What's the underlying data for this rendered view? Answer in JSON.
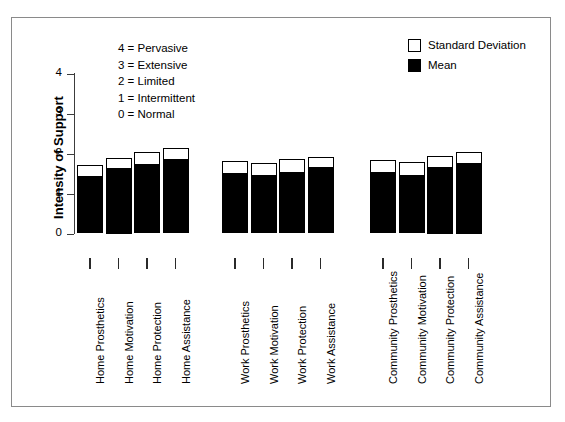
{
  "chart_data": {
    "type": "bar",
    "title": "",
    "xlabel": "",
    "ylabel": "Intensity of Support",
    "ylim": [
      0,
      4
    ],
    "ytick_labels": [
      "0",
      "1",
      "2",
      "3",
      "4"
    ],
    "ytick_values": [
      0,
      1,
      2,
      3,
      4
    ],
    "grid": false,
    "legend_position": "top-right",
    "categories": [
      "Home Prosthetics",
      "Home Motivation",
      "Home Protection",
      "Home Assistance",
      "Work Prosthetics",
      "Work Motivation",
      "Work Protection",
      "Work Assistance",
      "Community Prosthetics",
      "Community Motivation",
      "Community Protection",
      "Community Assistance"
    ],
    "series": [
      {
        "name": "Mean",
        "color": "#000000",
        "values": [
          1.45,
          1.65,
          1.75,
          1.88,
          1.53,
          1.47,
          1.55,
          1.68,
          1.55,
          1.48,
          1.68,
          1.78
        ]
      },
      {
        "name": "Standard Deviation",
        "color": "#ffffff",
        "note": "bar top = mean + standard deviation",
        "values": [
          1.72,
          1.9,
          2.03,
          2.13,
          1.82,
          1.76,
          1.87,
          1.92,
          1.84,
          1.78,
          1.95,
          2.05
        ]
      }
    ],
    "groups": [
      {
        "name": "Home",
        "categories": [
          "Home Prosthetics",
          "Home Motivation",
          "Home Protection",
          "Home Assistance"
        ]
      },
      {
        "name": "Work",
        "categories": [
          "Work Prosthetics",
          "Work Motivation",
          "Work Protection",
          "Work Assistance"
        ]
      },
      {
        "name": "Community",
        "categories": [
          "Community Prosthetics",
          "Community Motivation",
          "Community Protection",
          "Community Assistance"
        ]
      }
    ]
  },
  "scale_key": {
    "lines": [
      "4 = Pervasive",
      "3 = Extensive",
      "2 = Limited",
      "1 = Intermittent",
      "0 = Normal"
    ]
  },
  "legend": {
    "items": [
      {
        "label": "Standard Deviation",
        "swatch": "#ffffff"
      },
      {
        "label": "Mean",
        "swatch": "#000000"
      }
    ]
  }
}
